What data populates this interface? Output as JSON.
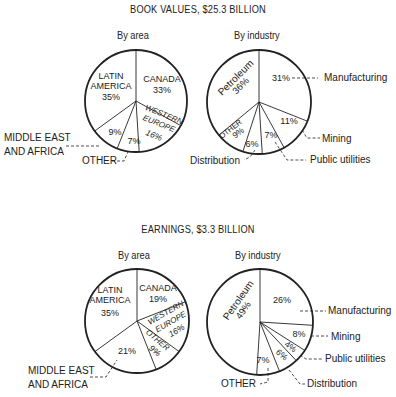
{
  "chart_data": [
    {
      "type": "pie",
      "group": "BOOK VALUES, $25.3 BILLION",
      "title": "By area",
      "start": "top",
      "direction": "clockwise",
      "slices": [
        {
          "label": "CANADA",
          "value": 33
        },
        {
          "label": "WESTERN EUROPE",
          "value": 16
        },
        {
          "label": "OTHER",
          "value": 7
        },
        {
          "label": "MIDDLE EAST AND AFRICA",
          "value": 9
        },
        {
          "label": "LATIN AMERICA",
          "value": 35
        }
      ]
    },
    {
      "type": "pie",
      "group": "BOOK VALUES, $25.3 BILLION",
      "title": "By industry",
      "start": "top",
      "direction": "clockwise",
      "slices": [
        {
          "label": "Manufacturing",
          "value": 31
        },
        {
          "label": "Mining",
          "value": 11
        },
        {
          "label": "Public utilities",
          "value": 7
        },
        {
          "label": "Distribution",
          "value": 6
        },
        {
          "label": "OTHER",
          "value": 9
        },
        {
          "label": "Petroleum",
          "value": 36
        }
      ]
    },
    {
      "type": "pie",
      "group": "EARNINGS, $3.3 BILLION",
      "title": "By area",
      "start": "top",
      "direction": "clockwise",
      "slices": [
        {
          "label": "CANADA",
          "value": 19
        },
        {
          "label": "WESTERN EUROPE",
          "value": 16
        },
        {
          "label": "OTHER",
          "value": 9
        },
        {
          "label": "MIDDLE EAST AND AFRICA",
          "value": 21
        },
        {
          "label": "LATIN AMERICA",
          "value": 35
        }
      ]
    },
    {
      "type": "pie",
      "group": "EARNINGS, $3.3 BILLION",
      "title": "By industry",
      "start": "top",
      "direction": "clockwise",
      "slices": [
        {
          "label": "Manufacturing",
          "value": 26
        },
        {
          "label": "Mining",
          "value": 8
        },
        {
          "label": "Public utilities",
          "value": 4
        },
        {
          "label": "Distribution",
          "value": 6
        },
        {
          "label": "OTHER",
          "value": 7
        },
        {
          "label": "Petroleum",
          "value": 49
        }
      ]
    }
  ],
  "headings": {
    "book_values": "BOOK VALUES, $25.3 BILLION",
    "earnings": "EARNINGS, $3.3 BILLION",
    "by_area": "By area",
    "by_industry": "By industry"
  },
  "colors": {
    "ink": "#222222",
    "background": "#ffffff"
  }
}
